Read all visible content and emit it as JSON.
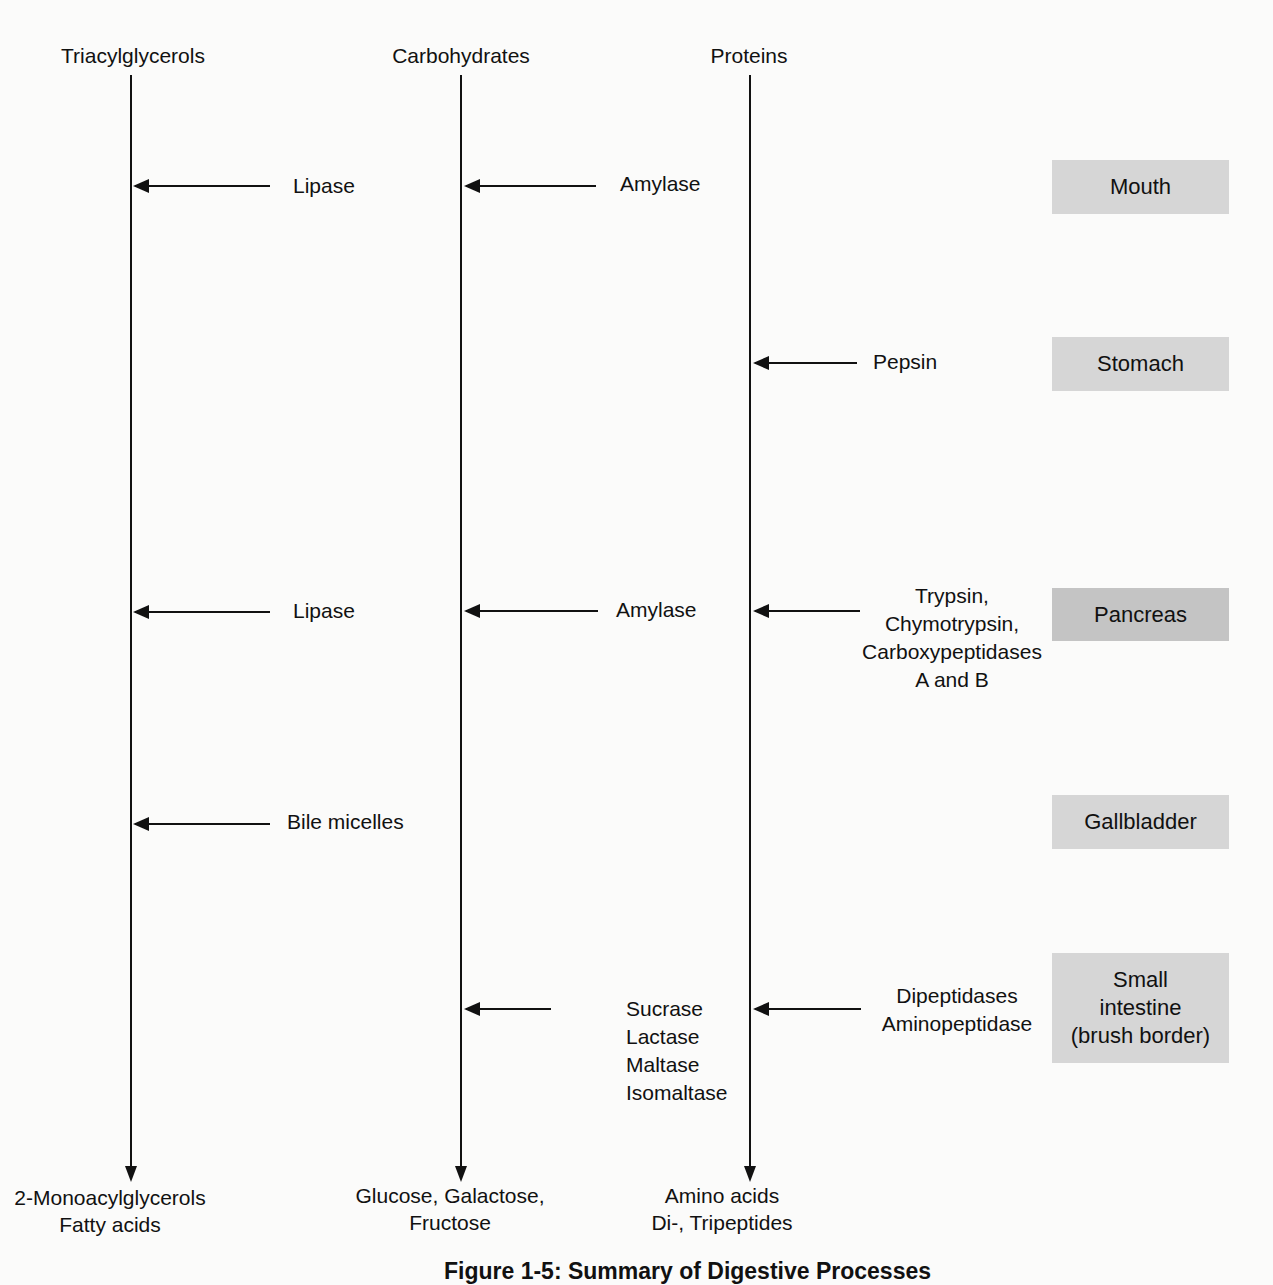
{
  "diagram": {
    "columns": [
      {
        "title": "Triacylglycerols",
        "products": [
          "2-Monoacylglycerols",
          "Fatty acids"
        ]
      },
      {
        "title": "Carbohydrates",
        "products": [
          "Glucose, Galactose,",
          "Fructose"
        ]
      },
      {
        "title": "Proteins",
        "products": [
          "Amino acids",
          "Di-, Tripeptides"
        ]
      }
    ],
    "organs": [
      {
        "label": "Mouth"
      },
      {
        "label": "Stomach"
      },
      {
        "label": "Pancreas"
      },
      {
        "label": "Gallbladder"
      },
      {
        "label_lines": [
          "Small",
          "intestine",
          "(brush border)"
        ]
      }
    ],
    "enzymes": {
      "mouth": {
        "lipids": "Lipase",
        "carbohydrates": "Amylase"
      },
      "stomach": {
        "proteins": "Pepsin"
      },
      "pancreas": {
        "lipids": "Lipase",
        "carbohydrates": "Amylase",
        "proteins": [
          "Trypsin,",
          "Chymotrypsin,",
          "Carboxypeptidases",
          "A and B"
        ]
      },
      "gallbladder": {
        "lipids": "Bile micelles"
      },
      "small_intestine": {
        "carbohydrates": [
          "Sucrase",
          "Lactase",
          "Maltase",
          "Isomaltase"
        ],
        "proteins": [
          "Dipeptidases",
          "Aminopeptidase"
        ]
      }
    },
    "caption": "Figure 1-5: Summary of Digestive Processes"
  }
}
